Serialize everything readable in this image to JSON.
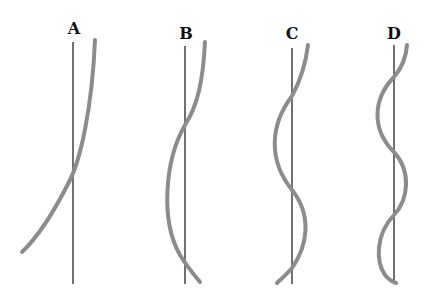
{
  "diagram": {
    "title_fragment": "· · · · g · · · · g · ·",
    "colors": {
      "axis": "#111111",
      "curve": "#8c8c8c"
    },
    "panels": [
      {
        "label": "A",
        "axis_x": 73,
        "label_x": 74,
        "label_y": 20,
        "curve": "M95,40 C92,110 80,160 70,180 C55,210 40,235 22,252"
      },
      {
        "label": "B",
        "axis_x": 185,
        "label_x": 186,
        "label_y": 25,
        "curve": "M205,42 C203,80 198,105 185,125 C165,160 160,220 180,255 C188,268 195,276 200,282"
      },
      {
        "label": "C",
        "axis_x": 292,
        "label_x": 292,
        "label_y": 25,
        "curve": "M308,45 C305,70 298,85 292,96 C270,125 268,160 292,190 C312,215 308,245 292,268 C286,275 280,280 277,283"
      },
      {
        "label": "D",
        "axis_x": 394,
        "label_x": 394,
        "label_y": 25,
        "curve": "M407,45 C406,60 400,70 394,77 C372,100 372,130 394,152 C412,172 408,200 394,215 C375,235 376,262 385,275 C389,280 393,282 396,283"
      }
    ]
  }
}
